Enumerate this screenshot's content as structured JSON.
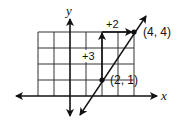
{
  "diagram": {
    "type": "coordinate-graph",
    "axes": {
      "x_label": "x",
      "y_label": "y"
    },
    "grid": {
      "x_range": [
        -2,
        4
      ],
      "y_range": [
        0,
        4
      ],
      "unit_px": 16
    },
    "points": [
      {
        "x": 2,
        "y": 1,
        "label": "(2, 1)"
      },
      {
        "x": 4,
        "y": 4,
        "label": "(4, 4)"
      }
    ],
    "rise": {
      "label": "+3",
      "value": 3
    },
    "run": {
      "label": "+2",
      "value": 2
    },
    "line": {
      "slope": 1.5,
      "through": [
        [
          2,
          1
        ],
        [
          4,
          4
        ]
      ]
    },
    "colors": {
      "ink": "#111111",
      "grid": "#222222",
      "background": "#ffffff"
    }
  }
}
